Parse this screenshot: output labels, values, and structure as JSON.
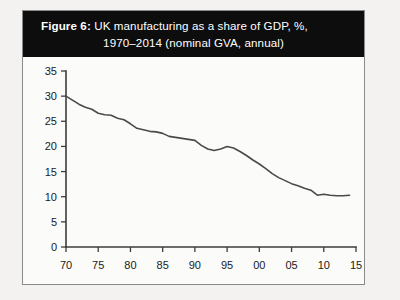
{
  "figure": {
    "label": "Figure 6:",
    "title_line1": "UK manufacturing as a share of GDP, %,",
    "title_line2": "1970–2014 (nominal GVA, annual)",
    "banner_color": "#0d0d0d",
    "banner_text_color": "#ffffff",
    "border_color": "#8a8a8a"
  },
  "chart_data": {
    "type": "line",
    "title": "Figure 6: UK manufacturing as a share of GDP, %, 1970–2014 (nominal GVA, annual)",
    "xlabel": "",
    "ylabel": "",
    "xlim": [
      1970,
      2015
    ],
    "ylim": [
      0,
      35
    ],
    "grid": false,
    "legend": "none",
    "line_color": "#4a4a4a",
    "axis_color": "#3c3c3c",
    "plot_background": "#fbfbfa",
    "y_ticks": [
      0,
      5,
      10,
      15,
      20,
      25,
      30,
      35
    ],
    "y_tick_labels": [
      "0",
      "5",
      "10",
      "15",
      "20",
      "25",
      "30",
      "35"
    ],
    "x_ticks": [
      1970,
      1975,
      1980,
      1985,
      1990,
      1995,
      2000,
      2005,
      2010,
      2015
    ],
    "x_tick_labels": [
      "70",
      "75",
      "80",
      "85",
      "90",
      "95",
      "00",
      "05",
      "10",
      "15"
    ],
    "series": [
      {
        "name": "UK manufacturing share of GDP",
        "x": [
          1970,
          1971,
          1972,
          1973,
          1974,
          1975,
          1976,
          1977,
          1978,
          1979,
          1980,
          1981,
          1982,
          1983,
          1984,
          1985,
          1986,
          1987,
          1988,
          1989,
          1990,
          1991,
          1992,
          1993,
          1994,
          1995,
          1996,
          1997,
          1998,
          1999,
          2000,
          2001,
          2002,
          2003,
          2004,
          2005,
          2006,
          2007,
          2008,
          2009,
          2010,
          2011,
          2012,
          2013,
          2014
        ],
        "values": [
          30.0,
          29.2,
          28.4,
          27.8,
          27.4,
          26.6,
          26.3,
          26.2,
          25.6,
          25.3,
          24.5,
          23.6,
          23.3,
          23.0,
          22.9,
          22.6,
          22.0,
          21.8,
          21.6,
          21.4,
          21.2,
          20.2,
          19.5,
          19.2,
          19.5,
          20.0,
          19.7,
          19.0,
          18.2,
          17.3,
          16.5,
          15.6,
          14.6,
          13.8,
          13.2,
          12.6,
          12.2,
          11.7,
          11.3,
          10.3,
          10.5,
          10.3,
          10.2,
          10.2,
          10.3
        ]
      }
    ]
  }
}
